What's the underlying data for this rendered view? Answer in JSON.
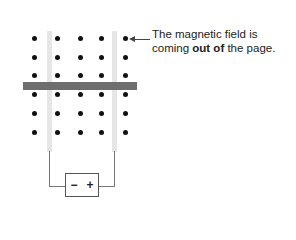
{
  "annotation": {
    "line1": "The magnetic field is",
    "line2_pre": "coming ",
    "line2_bold": "out of",
    "line2_post": " the page."
  },
  "battery": {
    "negative": "−",
    "positive": "+"
  },
  "field": {
    "symbol": "dot",
    "direction": "out of page",
    "rows": [
      38,
      57,
      75,
      94,
      113,
      132
    ],
    "cols": [
      34,
      57,
      80,
      101,
      125
    ]
  },
  "colors": {
    "rail": "#e6e6e6",
    "bar": "#6e6e6e",
    "dot": "#111111",
    "wire": "#777777"
  }
}
